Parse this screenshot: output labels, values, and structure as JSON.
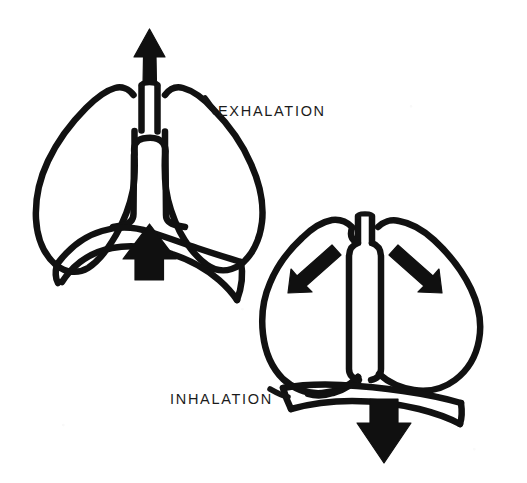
{
  "page": {
    "background_color": "#ffffff",
    "ink_color": "#111111",
    "width": 527,
    "height": 483
  },
  "labels": {
    "exhalation": "EXHALATION",
    "inhalation": "INHALATION"
  },
  "diagrams": [
    {
      "id": "exhalation",
      "label": "EXHALATION",
      "parts": {
        "trachea": "trachea",
        "left_lung": "left lung",
        "right_lung": "right lung",
        "mediastinum": "mediastinum",
        "diaphragm": "diaphragm, domed upward"
      },
      "arrows": [
        {
          "name": "air-out-arrow",
          "direction": "up",
          "meaning": "air flows out of trachea"
        },
        {
          "name": "diaphragm-rise-arrow",
          "direction": "up",
          "meaning": "diaphragm moves up"
        }
      ]
    },
    {
      "id": "inhalation",
      "label": "INHALATION",
      "parts": {
        "trachea": "trachea",
        "left_lung": "left lung",
        "right_lung": "right lung",
        "mediastinum": "mediastinum",
        "diaphragm": "diaphragm, flattened"
      },
      "arrows": [
        {
          "name": "air-in-left-arrow",
          "direction": "down-left",
          "meaning": "air flows into left lung"
        },
        {
          "name": "air-in-right-arrow",
          "direction": "down-right",
          "meaning": "air flows into right lung"
        },
        {
          "name": "diaphragm-drop-arrow",
          "direction": "down",
          "meaning": "diaphragm moves down"
        }
      ]
    }
  ]
}
